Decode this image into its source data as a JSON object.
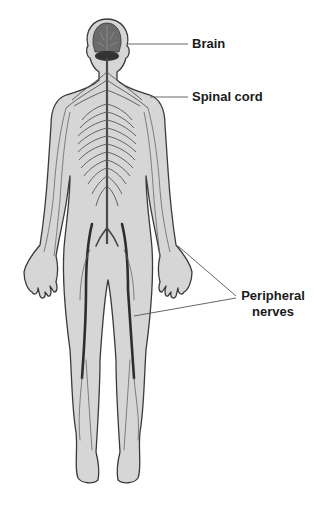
{
  "diagram": {
    "labels": {
      "brain": "Brain",
      "spinal_cord": "Spinal cord",
      "peripheral_line1": "Peripheral",
      "peripheral_line2": "nerves"
    },
    "colors": {
      "skin": "#d6d6d6",
      "outline": "#3a3a3a",
      "nerve": "#4a4a4a",
      "brain": "#5a5a5a",
      "leader": "#555555",
      "text": "#1a1a1a"
    }
  }
}
